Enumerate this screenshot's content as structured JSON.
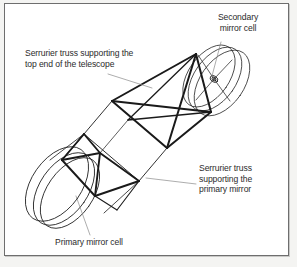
{
  "figure": {
    "kind": "line-drawing",
    "background_color": "#ffffff",
    "border_color": "#6e6e6e",
    "page_color": "#f4f4f2",
    "ink_color": "#1a1a1a",
    "leader_color": "#8a8a8a",
    "text_color": "#2b2b2b"
  },
  "labels": {
    "secondary_mirror_cell": "Secondary\nmirror cell",
    "top_truss": "Serrurier truss supporting the\ntop end of the telescope",
    "primary_truss": "Serrurier truss\nsupporting the\nprimary mirror",
    "primary_mirror_cell": "Primary mirror cell"
  },
  "parts": [
    "secondary mirror cell",
    "Serrurier truss supporting the top end of the telescope",
    "Serrurier truss supporting the primary mirror",
    "primary mirror cell"
  ]
}
